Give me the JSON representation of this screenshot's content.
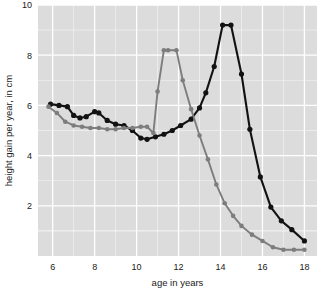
{
  "chart_data": {
    "type": "line",
    "title": "",
    "subtitle": "",
    "xlabel": "age in years",
    "ylabel": "height gain per year, in cm",
    "xlim": [
      5.3,
      18.6
    ],
    "ylim": [
      0.0,
      10.0
    ],
    "xticks": [
      6,
      8,
      10,
      12,
      14,
      16,
      18
    ],
    "xticklabels": [
      "6",
      "8",
      "10",
      "12",
      "14",
      "16",
      "18"
    ],
    "yticks": [
      2,
      4,
      6,
      8,
      10
    ],
    "yticklabels": [
      "2",
      "4",
      "6",
      "8",
      "10"
    ],
    "grid": true,
    "grid_color": "#ffffff",
    "plot_background": "#dcdcdc",
    "figure_background": "#ffffff",
    "legend": null,
    "legend_position": "none",
    "markers": true,
    "series": [
      {
        "name": "boys",
        "color": "#121212",
        "linewidth": 2.1,
        "marker": "circle",
        "marker_size": 2.6,
        "x": [
          5.9,
          6.3,
          6.7,
          7.0,
          7.3,
          7.6,
          8.0,
          8.2,
          8.6,
          9.0,
          9.4,
          9.8,
          10.2,
          10.5,
          10.9,
          11.3,
          11.7,
          12.1,
          12.6,
          13.0,
          13.3,
          13.7,
          14.1,
          14.5,
          15.0,
          15.4,
          15.9,
          16.4,
          16.9,
          17.4,
          18.0
        ],
        "y": [
          6.05,
          6.0,
          5.95,
          5.6,
          5.5,
          5.55,
          5.75,
          5.7,
          5.4,
          5.25,
          5.2,
          5.0,
          4.7,
          4.65,
          4.75,
          4.85,
          5.0,
          5.2,
          5.45,
          5.9,
          6.5,
          7.55,
          9.2,
          9.2,
          7.25,
          5.05,
          3.15,
          1.95,
          1.4,
          1.05,
          0.6
        ]
      },
      {
        "name": "girls",
        "color": "#7d7d7d",
        "linewidth": 1.9,
        "marker": "circle",
        "marker_size": 2.3,
        "x": [
          5.8,
          6.2,
          6.6,
          7.0,
          7.4,
          7.8,
          8.2,
          8.6,
          9.0,
          9.4,
          9.8,
          10.2,
          10.5,
          10.8,
          11.0,
          11.3,
          11.5,
          11.9,
          12.2,
          12.6,
          13.0,
          13.4,
          13.8,
          14.2,
          14.6,
          15.0,
          15.5,
          16.0,
          16.5,
          17.0,
          17.5,
          18.0
        ],
        "y": [
          5.95,
          5.7,
          5.35,
          5.2,
          5.15,
          5.1,
          5.1,
          5.05,
          5.05,
          5.1,
          5.1,
          5.15,
          5.15,
          4.9,
          6.55,
          8.2,
          8.2,
          8.2,
          7.0,
          5.85,
          4.8,
          3.85,
          2.85,
          2.1,
          1.6,
          1.2,
          0.85,
          0.6,
          0.35,
          0.25,
          0.25,
          0.25
        ]
      }
    ]
  },
  "axes": {
    "x_title": "age in years",
    "y_title": "height gain per year, in cm"
  }
}
